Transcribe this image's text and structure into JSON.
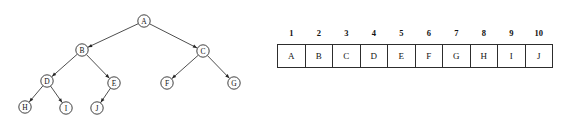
{
  "figure": {
    "background_color": "#ffffff",
    "line_color": "#3a3a3a",
    "node_fill": "#fdfdfd",
    "node_stroke": "#2b2b2b",
    "text_color": "#111111"
  },
  "tree": {
    "name": "binary-tree-diagram",
    "nodes": [
      {
        "id": "A",
        "label": "A",
        "x": 144,
        "y": 21,
        "r": 6.2
      },
      {
        "id": "B",
        "label": "B",
        "x": 82,
        "y": 50,
        "r": 6.2
      },
      {
        "id": "C",
        "label": "C",
        "x": 203,
        "y": 51,
        "r": 6.2
      },
      {
        "id": "D",
        "label": "D",
        "x": 47,
        "y": 81,
        "r": 6.2
      },
      {
        "id": "E",
        "label": "E",
        "x": 114,
        "y": 83,
        "r": 6.2
      },
      {
        "id": "F",
        "label": "F",
        "x": 167,
        "y": 83,
        "r": 6.2
      },
      {
        "id": "G",
        "label": "G",
        "x": 234,
        "y": 83,
        "r": 6.2
      },
      {
        "id": "H",
        "label": "H",
        "x": 25,
        "y": 107,
        "r": 6.2
      },
      {
        "id": "I",
        "label": "I",
        "x": 66,
        "y": 108,
        "r": 6.2
      },
      {
        "id": "J",
        "label": "J",
        "x": 97,
        "y": 108,
        "r": 6.2
      }
    ],
    "edges": [
      {
        "from": "B",
        "to": "A"
      },
      {
        "from": "C",
        "to": "A"
      },
      {
        "from": "D",
        "to": "B"
      },
      {
        "from": "E",
        "to": "B"
      },
      {
        "from": "F",
        "to": "C"
      },
      {
        "from": "G",
        "to": "C"
      },
      {
        "from": "H",
        "to": "D"
      },
      {
        "from": "I",
        "to": "D"
      },
      {
        "from": "J",
        "to": "E"
      }
    ]
  },
  "array_table": {
    "name": "array-representation-table",
    "indices": [
      "1",
      "2",
      "3",
      "4",
      "5",
      "6",
      "7",
      "8",
      "9",
      "10"
    ],
    "values": [
      "A",
      "B",
      "C",
      "D",
      "E",
      "F",
      "G",
      "H",
      "I",
      "J"
    ]
  }
}
